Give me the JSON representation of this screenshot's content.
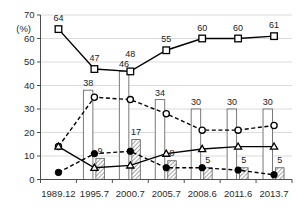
{
  "chart_data": {
    "type": "bar",
    "title": "",
    "subtitle": "",
    "xlabel": "",
    "ylabel": "",
    "unit_label": "(%)",
    "ylim": [
      0,
      70
    ],
    "ytick_values": [
      0,
      10,
      20,
      30,
      40,
      50,
      60,
      70
    ],
    "ytick_labels": [
      "0",
      "10",
      "20",
      "30",
      "40",
      "50",
      "60",
      "70"
    ],
    "grid": true,
    "legend": "none",
    "categories": [
      "1989.12",
      "1995.7",
      "2000.7",
      "2005.7",
      "2008.6",
      "2011.6",
      "2013.7"
    ],
    "series": [
      {
        "name": "white-bar",
        "kind": "bar",
        "style": "open",
        "values": [
          null,
          38,
          46,
          34,
          30,
          30,
          30
        ],
        "labels": [
          "",
          "38",
          "46",
          "34",
          "30",
          "30",
          "30"
        ]
      },
      {
        "name": "gray-hatched-bar",
        "kind": "bar",
        "style": "hatched",
        "values": [
          null,
          9,
          17,
          8,
          5,
          5,
          5
        ],
        "labels": [
          "",
          "9",
          "17",
          "8",
          "5",
          "5",
          "5"
        ]
      },
      {
        "name": "open-square-line",
        "kind": "line",
        "style": "solid",
        "marker": "open-square",
        "values": [
          64,
          47,
          46,
          55,
          60,
          60,
          61
        ],
        "labels": [
          "64",
          "47",
          "48",
          "55",
          "60",
          "60",
          "61"
        ]
      },
      {
        "name": "open-circle-line",
        "kind": "line",
        "style": "dashed",
        "marker": "open-circle",
        "values": [
          14,
          35,
          34,
          28,
          21,
          21,
          23
        ],
        "labels": [
          "",
          "",
          "",
          "",
          "",
          "",
          ""
        ]
      },
      {
        "name": "open-triangle-line",
        "kind": "line",
        "style": "solid",
        "marker": "open-triangle",
        "values": [
          14,
          5,
          6,
          11,
          13,
          14,
          14
        ],
        "labels": [
          "",
          "",
          "",
          "",
          "",
          "",
          ""
        ]
      },
      {
        "name": "filled-circle-line",
        "kind": "line",
        "style": "dashed",
        "marker": "filled-circle",
        "values": [
          3,
          11,
          12,
          5,
          5,
          4,
          2
        ],
        "labels": [
          "",
          "",
          "",
          "",
          "",
          "",
          ""
        ]
      }
    ],
    "colors": {
      "axis": "#4d4d4d",
      "grid": "#d7d7d7",
      "line": "#000000",
      "bar_fill_open": "#ffffff",
      "bar_fill_hatched": "#9e9e9e",
      "bar_stroke": "#6b6b6b",
      "text": "#1a1a1a"
    }
  }
}
